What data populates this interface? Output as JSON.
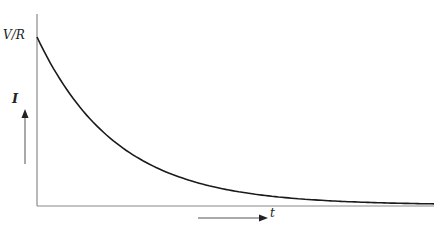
{
  "chart_data": {
    "type": "line",
    "title": "",
    "xlabel": "t",
    "ylabel": "I",
    "y_tick_labels": [
      "V/R"
    ],
    "x_tick_labels": [],
    "grid": false,
    "legend": null,
    "series": [
      {
        "name": "I(t)",
        "x": [
          0,
          0.5,
          1,
          1.5,
          2,
          2.5,
          3,
          3.5,
          4,
          4.5,
          5
        ],
        "values": [
          1.0,
          0.61,
          0.37,
          0.22,
          0.14,
          0.08,
          0.05,
          0.03,
          0.018,
          0.011,
          0.007
        ]
      }
    ],
    "ylim": [
      0,
      1.1
    ],
    "xlim": [
      0,
      5
    ]
  },
  "labels": {
    "y_top": "V/R",
    "y_var": "I",
    "x_var": "t"
  },
  "colors": {
    "curve": "#1a1a1a",
    "axis": "#8a8a8a",
    "arrow": "#333333"
  }
}
